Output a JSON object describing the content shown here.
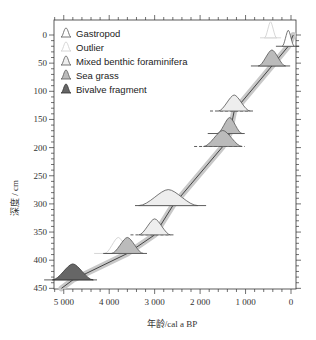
{
  "chart_data": {
    "type": "scatter",
    "title": "",
    "xlabel": "年龄/cal a BP",
    "ylabel": "深度 / cm",
    "xlim": [
      5300,
      -80
    ],
    "ylim": [
      0,
      450
    ],
    "x_reversed": true,
    "y_reversed": true,
    "x_ticks": [
      5000,
      4000,
      3000,
      2000,
      1000,
      0
    ],
    "x_tick_labels": [
      "5 000",
      "4 000",
      "3 000",
      "2 000",
      "1 000",
      "0"
    ],
    "y_ticks": [
      0,
      50,
      100,
      150,
      200,
      250,
      300,
      350,
      400,
      450
    ],
    "y_tick_labels": [
      "0",
      "50",
      "100",
      "150",
      "200",
      "250",
      "300",
      "350",
      "400",
      "450"
    ],
    "legend_position": "upper-left",
    "legend": [
      {
        "label": "Gastropod",
        "fill": "#ffffff",
        "stroke": "#555555"
      },
      {
        "label": "Outlier",
        "fill": "#ffffff",
        "stroke": "#cccccc"
      },
      {
        "label": "Mixed benthic foraminifera",
        "fill": "#eeeeee",
        "stroke": "#555555"
      },
      {
        "label": "Sea grass",
        "fill": "#bbbbbb",
        "stroke": "#555555"
      },
      {
        "label": "Bivalve fragment",
        "fill": "#666666",
        "stroke": "#333333"
      }
    ],
    "age_depth_model": {
      "depth": [
        0,
        20,
        55,
        135,
        175,
        198,
        303,
        355,
        388,
        435,
        450
      ],
      "age": [
        -50,
        60,
        420,
        1250,
        1350,
        1500,
        2600,
        3000,
        3600,
        4800,
        5050
      ]
    },
    "dates": [
      {
        "type": "Outlier",
        "depth": 5,
        "age": 450,
        "range": [
          350,
          550
        ]
      },
      {
        "type": "Gastropod",
        "depth": 20,
        "age": 60,
        "range": [
          -50,
          200
        ]
      },
      {
        "type": "Sea grass",
        "depth": 55,
        "age": 420,
        "range": [
          150,
          750
        ]
      },
      {
        "type": "Mixed benthic foraminifera",
        "depth": 135,
        "age": 1250,
        "range": [
          950,
          1650
        ],
        "dashed": true
      },
      {
        "type": "Sea grass",
        "depth": 175,
        "age": 1350,
        "range": [
          1150,
          1700
        ]
      },
      {
        "type": "Sea grass",
        "depth": 198,
        "age": 1500,
        "range": [
          1150,
          2000
        ],
        "dashed": true
      },
      {
        "type": "Mixed benthic foraminifera",
        "depth": 303,
        "age": 2700,
        "range": [
          2000,
          3300
        ]
      },
      {
        "type": "Mixed benthic foraminifera",
        "depth": 355,
        "age": 3000,
        "range": [
          2700,
          3400
        ],
        "dashed": true
      },
      {
        "type": "Outlier",
        "depth": 388,
        "age": 3800,
        "range": [
          3600,
          4200
        ]
      },
      {
        "type": "Sea grass",
        "depth": 388,
        "age": 3600,
        "range": [
          3300,
          4000
        ]
      },
      {
        "type": "Bivalve fragment",
        "depth": 435,
        "age": 4800,
        "range": [
          4400,
          5300
        ]
      }
    ]
  }
}
